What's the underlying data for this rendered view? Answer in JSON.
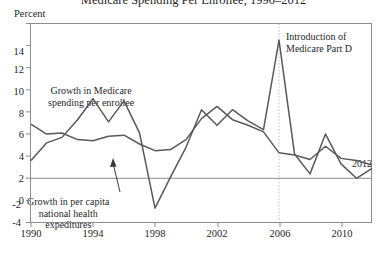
{
  "chart_data": {
    "type": "line",
    "title": "Medicare Spending Per Enrollee, 1990–2012",
    "ylabel": "Percent",
    "xlabel": "",
    "xlim": [
      1990,
      2012
    ],
    "ylim": [
      -4,
      14
    ],
    "y_ticks": [
      -4,
      -2,
      0,
      2,
      4,
      6,
      8,
      10,
      12,
      14
    ],
    "x_ticks": [
      1990,
      1994,
      1998,
      2002,
      2006,
      2010
    ],
    "x_tick_labels": [
      "1990",
      "1994",
      "1998",
      "2002",
      "2006",
      "2010"
    ],
    "y_tick_labels": [
      "-4",
      "-2",
      "0",
      "2",
      "4",
      "6",
      "8",
      "10",
      "12",
      "14"
    ],
    "grid": false,
    "legend": "none",
    "x": [
      1990,
      1991,
      1992,
      1993,
      1994,
      1995,
      1996,
      1997,
      1998,
      1999,
      2000,
      2001,
      2002,
      2003,
      2004,
      2005,
      2006,
      2007,
      2008,
      2009,
      2010,
      2011,
      2012
    ],
    "series": [
      {
        "name": "Growth in Medicare spending per enrollee",
        "color": "#595959",
        "values": [
          1.6,
          3.2,
          3.7,
          5.3,
          7.2,
          5.1,
          7.0,
          4.1,
          -2.7,
          0.1,
          2.8,
          6.2,
          4.8,
          6.2,
          5.2,
          4.4,
          12.5,
          2.2,
          0.4,
          4.0,
          1.3,
          0.0,
          0.9
        ]
      },
      {
        "name": "Growth in per capita national health expeditures",
        "color": "#595959",
        "values": [
          4.9,
          4.0,
          4.1,
          3.5,
          3.4,
          3.8,
          3.9,
          3.1,
          2.5,
          2.6,
          3.5,
          5.4,
          6.5,
          5.3,
          4.8,
          4.2,
          2.3,
          2.1,
          1.7,
          2.9,
          1.8,
          1.6,
          1.2
        ]
      }
    ],
    "annotations": [
      {
        "id": "medicare-line-label",
        "text_line1": "Growth in Medicare",
        "text_line2": "spending per enrollee"
      },
      {
        "id": "nhe-line-label",
        "text_line1": "Growth in per capita",
        "text_line2": "national health",
        "text_line3": "expeditures"
      },
      {
        "id": "part-d-marker",
        "text_line1": "Introduction of",
        "text_line2": "Medicare Part D",
        "at_x": 2006
      },
      {
        "id": "end-year-label",
        "text": "2012"
      }
    ],
    "colors": {
      "line": "#595959",
      "axis": "#8c8c8c",
      "zero_line": "#8c8c8c",
      "marker_line": "#bfbfbf",
      "text": "#1f1f1f"
    }
  }
}
